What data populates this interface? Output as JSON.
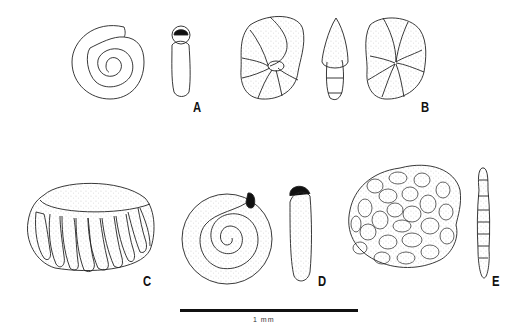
{
  "figure": {
    "panels": [
      {
        "id": "A",
        "label": "A",
        "views": [
          "spiral-side-view",
          "apertural-edge-view"
        ]
      },
      {
        "id": "B",
        "label": "B",
        "views": [
          "umbilical-view",
          "edge-view",
          "spiral-view"
        ]
      },
      {
        "id": "C",
        "label": "C",
        "views": [
          "oblique-side-view"
        ]
      },
      {
        "id": "D",
        "label": "D",
        "views": [
          "spiral-side-view",
          "apertural-edge-view"
        ]
      },
      {
        "id": "E",
        "label": "E",
        "views": [
          "side-view",
          "edge-view"
        ]
      }
    ],
    "scale_bar": {
      "label": "1 mm"
    }
  }
}
